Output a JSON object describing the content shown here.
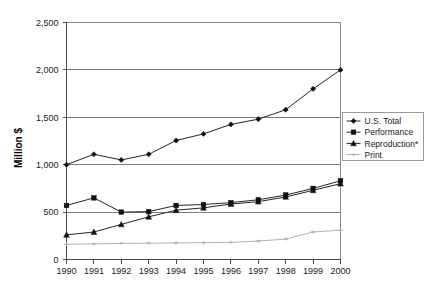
{
  "chart_data": {
    "type": "line",
    "title": "",
    "xlabel": "",
    "ylabel": "Million $",
    "xlim": [
      1990,
      2000
    ],
    "ylim": [
      0,
      2500
    ],
    "ytick_values": [
      0,
      500,
      1000,
      1500,
      2000,
      2500
    ],
    "ytick_labels": [
      "0",
      "500",
      "1,000",
      "1,500",
      "2,000",
      "2,500"
    ],
    "grid": true,
    "grid_axis": "y",
    "legend_position": "right-middle",
    "categories": [
      1990,
      1991,
      1992,
      1993,
      1994,
      1995,
      1996,
      1997,
      1998,
      1999,
      2000
    ],
    "xtick_labels": [
      "1990",
      "1991",
      "1992",
      "1993",
      "1994",
      "1995",
      "1996",
      "1997",
      "1998",
      "1999",
      "2000"
    ],
    "series": [
      {
        "name": "U.S. Total",
        "marker": "diamond",
        "color": "#262626",
        "values": [
          1000,
          1110,
          1050,
          1110,
          1255,
          1325,
          1425,
          1480,
          1580,
          1800,
          2000
        ]
      },
      {
        "name": "Performance",
        "marker": "square",
        "color": "#262626",
        "values": [
          570,
          650,
          500,
          505,
          570,
          580,
          600,
          630,
          680,
          750,
          830
        ]
      },
      {
        "name": "Reproduction*",
        "marker": "triangle",
        "color": "#262626",
        "values": [
          260,
          290,
          370,
          450,
          520,
          545,
          585,
          610,
          660,
          730,
          800
        ]
      },
      {
        "name": "Print",
        "marker": "dash",
        "color": "#b3b3b3",
        "values": [
          160,
          165,
          170,
          172,
          175,
          178,
          180,
          195,
          215,
          290,
          310
        ]
      }
    ]
  },
  "axis": {
    "y_title": "Million $"
  },
  "legend": {
    "entries": [
      {
        "label": "U.S. Total"
      },
      {
        "label": "Performance"
      },
      {
        "label": "Reproduction*"
      },
      {
        "label": "Print"
      }
    ]
  }
}
